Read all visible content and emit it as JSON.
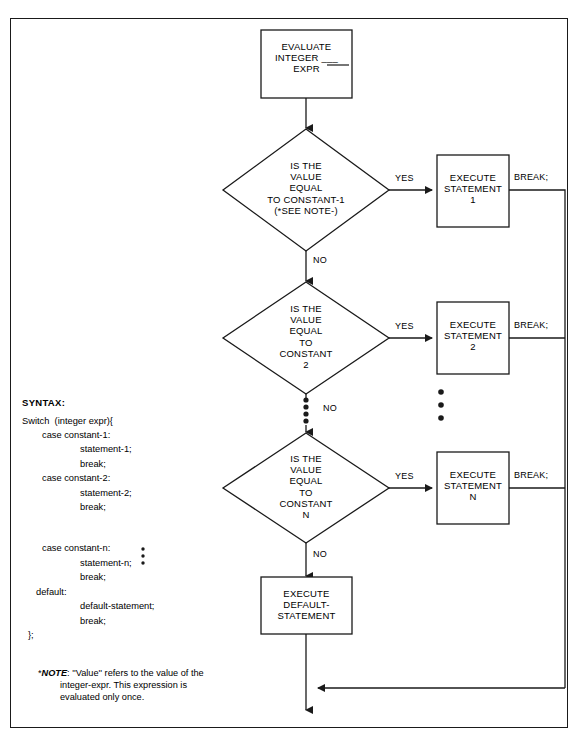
{
  "diagram": {
    "start_box": {
      "lines": [
        "EVALUATE",
        "INTEGER ___",
        "EXPR"
      ]
    },
    "decisions": [
      {
        "lines": [
          "IS THE",
          "VALUE",
          "EQUAL",
          "TO  CONSTANT-1",
          "(*SEE NOTE-)"
        ],
        "yes": "YES",
        "no": "NO"
      },
      {
        "lines": [
          "IS THE",
          "VALUE",
          "EQUAL",
          "TO",
          "CONSTANT",
          "2"
        ],
        "yes": "YES",
        "no": "NO"
      },
      {
        "lines": [
          "IS THE",
          "VALUE",
          "EQUAL",
          "TO",
          "CONSTANT",
          "N"
        ],
        "yes": "YES",
        "no": "NO"
      }
    ],
    "actions": [
      {
        "lines": [
          "EXECUTE",
          "STATEMENT",
          "1"
        ],
        "break_label": "BREAK;"
      },
      {
        "lines": [
          "EXECUTE",
          "STATEMENT",
          "2"
        ],
        "break_label": "BREAK;"
      },
      {
        "lines": [
          "EXECUTE",
          "STATEMENT",
          "N"
        ],
        "break_label": "BREAK;"
      }
    ],
    "default_box": {
      "lines": [
        "EXECUTE",
        "DEFAULT-",
        "STATEMENT"
      ]
    },
    "ellipsis_decision": "•••••",
    "ellipsis_action": "•••",
    "stroke_color": "#1a1a1a"
  },
  "syntax": {
    "header": "SYNTAX:",
    "lines": [
      {
        "text": "Switch  (integer expr){",
        "indent": "i0"
      },
      {
        "text": "case constant-1:",
        "indent": "i1"
      },
      {
        "text": "statement-1;",
        "indent": "i2"
      },
      {
        "text": "break;",
        "indent": "i2"
      },
      {
        "text": "case constant-2:",
        "indent": "i1"
      },
      {
        "text": "statement-2;",
        "indent": "i2"
      },
      {
        "text": "break;",
        "indent": "i2"
      },
      {
        "text": "case constant-n:",
        "indent": "i1"
      },
      {
        "text": "statement-n;",
        "indent": "i2"
      },
      {
        "text": "break;",
        "indent": "i2"
      },
      {
        "text": "default:",
        "indent": "i3"
      },
      {
        "text": "default-statement;",
        "indent": "i2"
      },
      {
        "text": "break;",
        "indent": "i2"
      },
      {
        "text": "};",
        "indent": "i4"
      }
    ],
    "dots": "•"
  },
  "note": {
    "marker": "*",
    "bold_word": "NOTE",
    "line1": ": ''Value'' refers to the value of the",
    "line2": "integer-expr. This expression is",
    "line3": "evaluated only once."
  }
}
